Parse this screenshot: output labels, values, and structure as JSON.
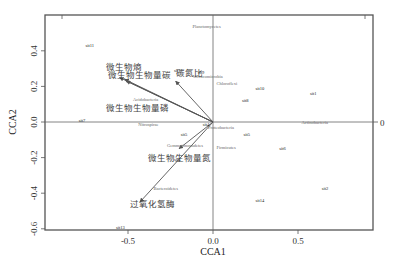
{
  "chart_data": {
    "type": "scatter",
    "subtype": "CCA biplot",
    "title": "",
    "xlabel": "CCA1",
    "ylabel": "CCA2",
    "xlim": [
      -1.0,
      0.95
    ],
    "ylim": [
      -0.61,
      0.6
    ],
    "x_ticks": [
      -0.5,
      0.0,
      0.5
    ],
    "x_tick_labels": [
      "-0.5",
      "0.0",
      "0.5"
    ],
    "y_ticks": [
      -0.6,
      -0.4,
      -0.2,
      0.0,
      0.2,
      0.4
    ],
    "y_tick_labels": [
      "-0.6",
      "-0.4",
      "-0.2",
      "0.0",
      "0.2",
      "0.4"
    ],
    "right_axis_label": "0",
    "top_right_tick": true,
    "grid": false,
    "origin_lines": true,
    "sites": [
      {
        "label": "sit1",
        "x": 0.57,
        "y": 0.15
      },
      {
        "label": "sit2",
        "x": 0.64,
        "y": -0.38
      },
      {
        "label": "sit4",
        "x": -0.23,
        "y": -0.22
      },
      {
        "label": "sit5",
        "x": -0.19,
        "y": -0.08
      },
      {
        "label": "sit6",
        "x": 0.39,
        "y": -0.16
      },
      {
        "label": "sit7",
        "x": -0.79,
        "y": 0.0
      },
      {
        "label": "sit8",
        "x": 0.17,
        "y": 0.11
      },
      {
        "label": "sit9",
        "x": -0.09,
        "y": 0.27
      },
      {
        "label": "sit10",
        "x": 0.25,
        "y": 0.18
      },
      {
        "label": "sit11",
        "x": -0.75,
        "y": 0.42
      },
      {
        "label": "sit12",
        "x": -0.23,
        "y": 0.28
      },
      {
        "label": "sit13",
        "x": -0.57,
        "y": -0.6
      },
      {
        "label": "sit14",
        "x": 0.25,
        "y": -0.45
      },
      {
        "label": "sit4b",
        "display": "sit4",
        "x": -0.06,
        "y": -0.02
      },
      {
        "label": "sit5b",
        "display": "sit5",
        "x": 0.18,
        "y": -0.08
      }
    ],
    "species": [
      {
        "label": "Planctomycetes",
        "x": -0.12,
        "y": 0.53
      },
      {
        "label": "Verrucomicrobia",
        "x": -0.12,
        "y": 0.25
      },
      {
        "label": "Chloroflexi",
        "x": 0.02,
        "y": 0.21
      },
      {
        "label": "Acidobacteria",
        "x": -0.47,
        "y": 0.12
      },
      {
        "label": "Nitrospirae",
        "x": -0.44,
        "y": -0.02
      },
      {
        "label": "Proteobacteria",
        "x": -0.03,
        "y": -0.04
      },
      {
        "label": "Actinobacteria",
        "x": 0.52,
        "y": -0.01
      },
      {
        "label": "Gemmatimonadetes",
        "x": -0.27,
        "y": -0.14
      },
      {
        "label": "Firmicutes",
        "x": 0.02,
        "y": -0.15
      },
      {
        "label": "Bacteroidetes",
        "x": -0.35,
        "y": -0.38
      }
    ],
    "env_vectors": [
      {
        "label": "微生物熵",
        "x": -0.55,
        "y": 0.25,
        "label_x": -0.63,
        "label_y": 0.29
      },
      {
        "label": "微生物生物量碳",
        "x": -0.52,
        "y": 0.24,
        "label_x": -0.62,
        "label_y": 0.25
      },
      {
        "label": "碳氮比",
        "x": -0.22,
        "y": 0.23,
        "label_x": -0.22,
        "label_y": 0.26
      },
      {
        "label": "微生物生物量磷",
        "x": -0.51,
        "y": 0.23,
        "label_x": -0.63,
        "label_y": 0.06
      },
      {
        "label": "微生物生物量氮",
        "x": -0.2,
        "y": -0.15,
        "label_x": -0.38,
        "label_y": -0.22
      },
      {
        "label": "过氧化氢酶",
        "x": -0.43,
        "y": -0.45,
        "label_x": -0.49,
        "label_y": -0.48
      }
    ]
  },
  "colors": {
    "frame": "#555555",
    "axis_line": "#666666",
    "vector": "#555555",
    "site_text": "#222222",
    "species_text": "#777777",
    "env_text": "#444444"
  }
}
